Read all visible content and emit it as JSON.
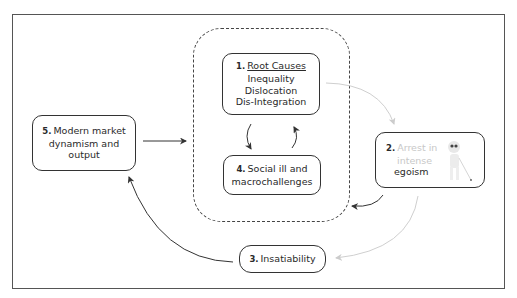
{
  "diagram": {
    "nodes": [
      {
        "id": "1",
        "number": "1.",
        "title": "Root Causes",
        "lines": [
          "Inequality",
          "Dislocation",
          "Dis-Integration"
        ]
      },
      {
        "id": "2",
        "number": "2.",
        "title_faint": "Arrest in",
        "line_faint": "intense",
        "line": "egoism",
        "icon": "blind-figure-with-cane-icon"
      },
      {
        "id": "3",
        "number": "3.",
        "title": "Insatiability"
      },
      {
        "id": "4",
        "number": "4.",
        "line1": "Social ill and",
        "line2": "macrochallenges"
      },
      {
        "id": "5",
        "number": "5.",
        "line1": "Modern market",
        "line2": "dynamism and",
        "line3": "output"
      }
    ],
    "edges": [
      {
        "from": "5",
        "to": "dashed-group",
        "style": "solid"
      },
      {
        "from": "1",
        "to": "4",
        "style": "solid"
      },
      {
        "from": "4",
        "to": "1",
        "style": "solid"
      },
      {
        "from": "1",
        "to": "2",
        "style": "faint"
      },
      {
        "from": "2",
        "to": "dashed-group",
        "style": "solid"
      },
      {
        "from": "2",
        "to": "3",
        "style": "faint"
      },
      {
        "from": "3",
        "to": "5",
        "style": "solid"
      }
    ],
    "colors": {
      "line": "#333333",
      "faint": "#cfcfcf",
      "dashed": "#444444"
    }
  }
}
